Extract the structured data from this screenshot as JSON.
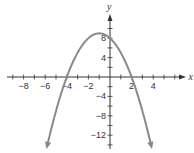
{
  "chart_data": {
    "type": "line",
    "title": "",
    "xlabel": "x",
    "ylabel": "y",
    "xlim": [
      -9,
      6.5
    ],
    "ylim": [
      -15,
      11
    ],
    "x_ticks": [
      -8,
      -6,
      -4,
      -2,
      2,
      4
    ],
    "y_ticks": [
      8,
      4,
      -4,
      -8,
      -12
    ],
    "x_tick_labels": [
      "−8",
      "−6",
      "−4",
      "−2",
      "2",
      "4"
    ],
    "y_tick_labels": [
      "8",
      "4",
      "−4",
      "−8",
      "−12"
    ],
    "x_minor_tick_step": 1,
    "y_minor_tick_step": 2,
    "grid": false,
    "legend": null,
    "series": [
      {
        "name": "parabola",
        "equation": "y = -(x + 4)(x - 2)",
        "vertex": [
          -1,
          9
        ],
        "x_intercepts": [
          -4,
          2
        ],
        "y_intercept": 8,
        "opens": "down",
        "ends_with_arrows": true,
        "x": [
          -5.84,
          -5,
          -4,
          -3,
          -2,
          -1,
          0,
          1,
          2,
          3,
          3.84
        ],
        "values": [
          -14.4,
          -7,
          0,
          5,
          8,
          9,
          8,
          5,
          0,
          -7,
          -14.4
        ]
      }
    ]
  },
  "colors": {
    "axis": "#333333",
    "curve": "#8a8a8a",
    "text": "#333333"
  }
}
